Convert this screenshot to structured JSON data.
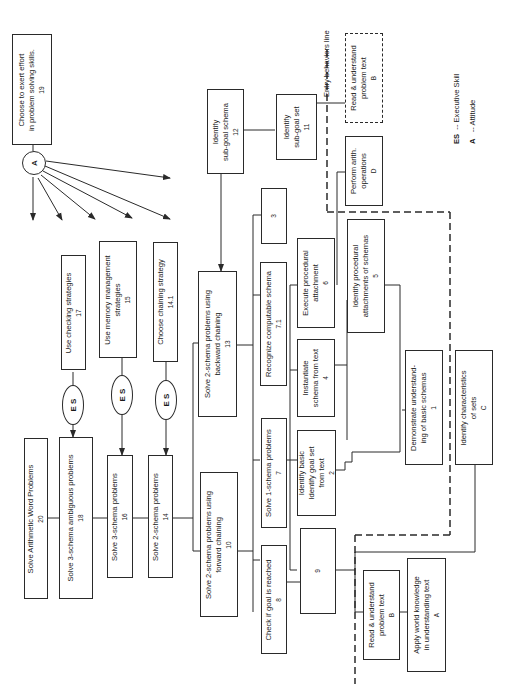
{
  "diagram": {
    "type": "instructional hierarchy / learning task analysis",
    "orientation": "rotated 90 degrees counter-clockwise",
    "nodes": [
      {
        "id": "20",
        "label": "Solve Arithmetic Word Problems",
        "num": "20"
      },
      {
        "id": "18",
        "label": "Solve 3-schema ambiguous problems",
        "num": "18"
      },
      {
        "id": "16",
        "label": "Solve 3-schema problems",
        "num": "16"
      },
      {
        "id": "14",
        "label": "Solve 2-schema problems",
        "num": "14"
      },
      {
        "id": "10",
        "label1": "Solve 2-schema problems using",
        "label2": "forward chaining",
        "num": "10"
      },
      {
        "id": "13",
        "label1": "Solve 2-schema problems using",
        "label2": "backward chaining",
        "num": "13"
      },
      {
        "id": "17",
        "label": "Use checking strategies",
        "num": "17"
      },
      {
        "id": "15",
        "label1": "Use memory management",
        "label2": "strategies",
        "num": "15"
      },
      {
        "id": "14.1",
        "label": "Choose chaining strategy",
        "num": "14.1"
      },
      {
        "id": "19",
        "label1": "Choose to exert effort",
        "label2": "in problem solving skills.",
        "num": "19"
      },
      {
        "id": "12",
        "label1": "Identify",
        "label2": "sub-goal schema",
        "num": "12"
      },
      {
        "id": "11",
        "label1": "Identify",
        "label2": "sub-goal set",
        "num": "11"
      },
      {
        "id": "8",
        "label": "Check if goal is reached",
        "num": "8"
      },
      {
        "id": "7",
        "label": "Solve 1-schema problems",
        "num": "7"
      },
      {
        "id": "7.1",
        "label": "Recognize computable schema",
        "num": "7.1"
      },
      {
        "id": "9",
        "label": "Chain schemas",
        "num": "9"
      },
      {
        "id": "2",
        "label1": "Identify goal set",
        "label2": "from text",
        "num": "2"
      },
      {
        "id": "3",
        "label1": "Identify basic",
        "label2": "schema from text",
        "num": "3"
      },
      {
        "id": "4",
        "label1": "Instantiate",
        "label2": "schema from text",
        "num": "4"
      },
      {
        "id": "6",
        "label1": "Execute procedural",
        "label2": "attachment",
        "num": "6"
      },
      {
        "id": "5",
        "label1": "Identify procedural",
        "label2": "attachments of schemas",
        "num": "5"
      },
      {
        "id": "1",
        "label1": "Demonstrate understand-",
        "label2": "ing of basic schemas",
        "num": "1"
      },
      {
        "id": "B",
        "label1": "Read & understand",
        "label2": "problem text",
        "num": "B"
      },
      {
        "id": "A",
        "label1": "Apply world knowledge",
        "label2": "in understanding text",
        "num": "A"
      },
      {
        "id": "C",
        "label1": "Identify characteristics",
        "label2": "of sets",
        "num": "C"
      },
      {
        "id": "D",
        "label1": "Perform arith.",
        "label2": "operations",
        "num": "D"
      },
      {
        "id": "B-top",
        "label1": "Read & understand",
        "label2": "problem text",
        "num": "B"
      }
    ],
    "es_label": "E S",
    "attitude_label": "A",
    "entry_line_label": "Entry behaviors line",
    "legend": [
      {
        "key": "ES",
        "desc": "-- Executive Skill"
      },
      {
        "key": "A",
        "desc": "-- Attitude"
      }
    ],
    "colors": {
      "line": "#2a2a2a",
      "background": "#ffffff"
    }
  }
}
